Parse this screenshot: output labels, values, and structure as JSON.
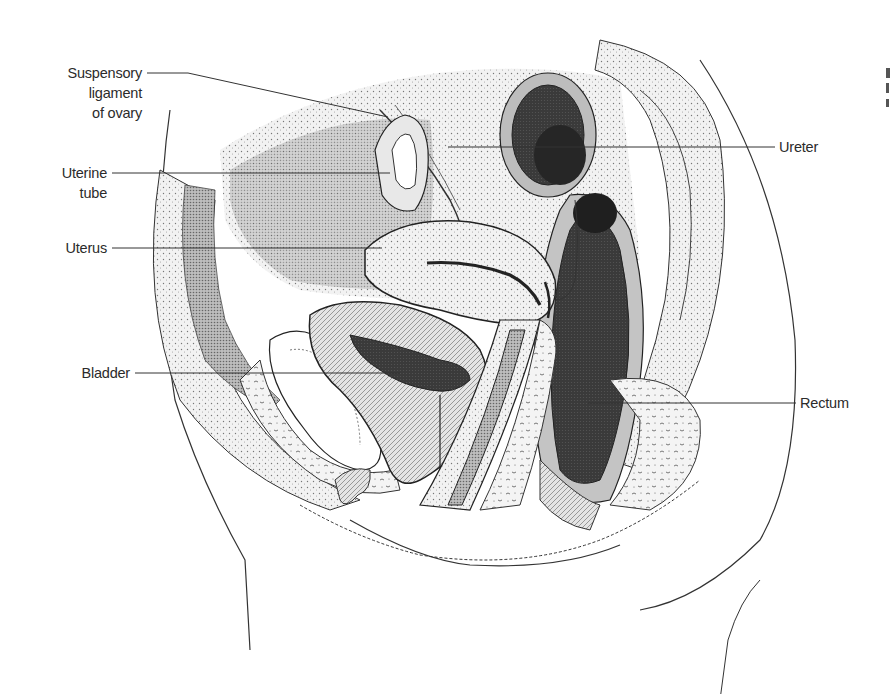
{
  "figure": {
    "type": "anatomical-illustration",
    "colors": {
      "ink": "#2a2a2a",
      "dark_fill": "#3d3d3d",
      "mid_fill": "#8c8c8c",
      "light_fill": "#d9d9d9",
      "paper": "#ffffff"
    }
  },
  "labels": [
    {
      "id": "suspensory-ligament",
      "lines": [
        "Suspensory",
        "ligament",
        "of ovary"
      ],
      "side": "left"
    },
    {
      "id": "uterine-tube",
      "lines": [
        "Uterine",
        "tube"
      ],
      "side": "left"
    },
    {
      "id": "uterus",
      "lines": [
        "Uterus"
      ],
      "side": "left"
    },
    {
      "id": "bladder",
      "lines": [
        "Bladder"
      ],
      "side": "left"
    },
    {
      "id": "ureter",
      "lines": [
        "Ureter"
      ],
      "side": "right"
    },
    {
      "id": "rectum",
      "lines": [
        "Rectum"
      ],
      "side": "right"
    }
  ]
}
